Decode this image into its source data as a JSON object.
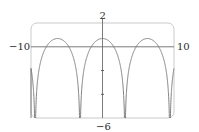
{
  "chart_data": {
    "type": "line",
    "title": "",
    "function": "y = ln(1 + cos x)",
    "xlabel": "",
    "ylabel": "",
    "xlim": [
      -10,
      10
    ],
    "ylim": [
      -6,
      2
    ],
    "tick_labels": {
      "x_min": "−10",
      "x_max": "10",
      "y_max": "2",
      "y_min": "−6"
    },
    "y_ticks": [
      -4,
      -2
    ],
    "grid": false,
    "legend": null,
    "series": [
      {
        "name": "f(x)",
        "peaks": [
          {
            "x": -6.28,
            "y": 0.69
          },
          {
            "x": 0,
            "y": 0.69
          },
          {
            "x": 6.28,
            "y": 0.69
          }
        ],
        "vertical_asymptotes": [
          -9.42,
          -3.14,
          3.14,
          9.42
        ],
        "x_intercepts": [
          -7.85,
          -4.71,
          -1.57,
          1.57,
          4.71,
          7.85
        ]
      }
    ],
    "colors": {
      "curve": "#6a6a6a",
      "axes": "#6a6a6a",
      "frame": "#bdbdbd"
    }
  }
}
